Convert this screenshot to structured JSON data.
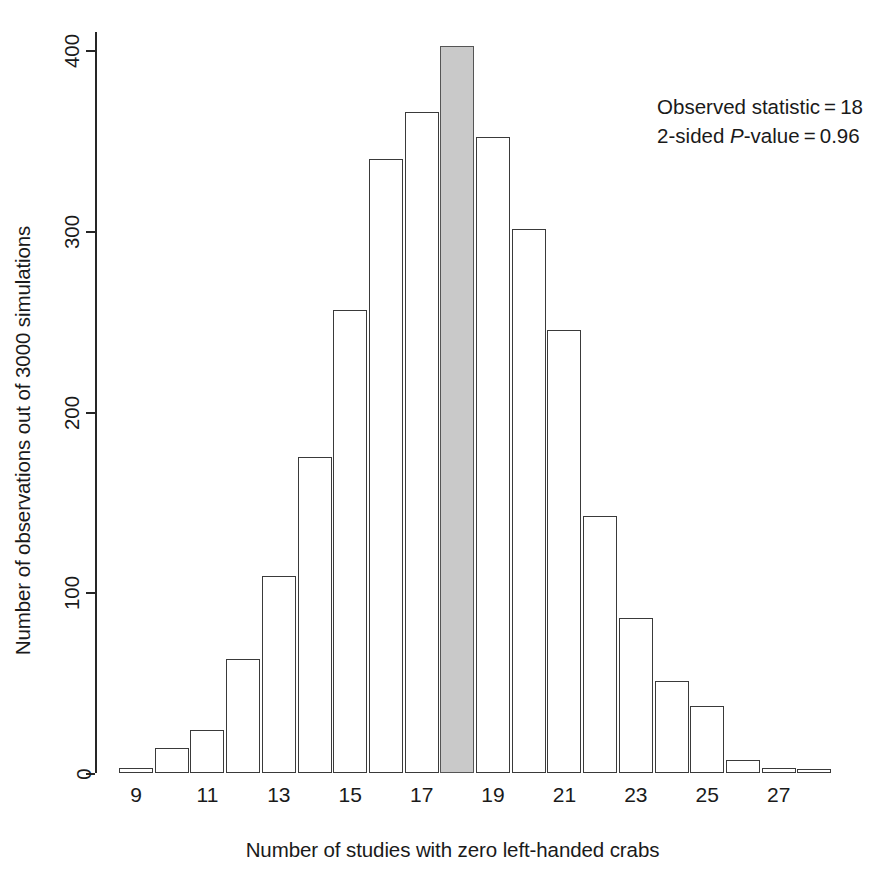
{
  "chart_data": {
    "type": "bar",
    "title": "",
    "xlabel": "Number of studies with zero left-handed crabs",
    "ylabel": "Number of observations out of 3000 simulations",
    "categories": [
      9,
      10,
      11,
      12,
      13,
      14,
      15,
      16,
      17,
      18,
      19,
      20,
      21,
      22,
      23,
      24,
      25,
      26,
      27,
      28
    ],
    "values": [
      3,
      14,
      24,
      63,
      109,
      175,
      256,
      340,
      366,
      402,
      352,
      301,
      245,
      142,
      86,
      51,
      37,
      7,
      3,
      1
    ],
    "highlight_category": 18,
    "highlight_color": "#c9c9c9",
    "bar_edge_color": "#3a3a3a",
    "bar_fill_color": "#ffffff",
    "ylim": [
      0,
      410
    ],
    "ytick_values": [
      0,
      100,
      200,
      300,
      400
    ],
    "ytick_labels": [
      "0",
      "100",
      "200",
      "300",
      "400"
    ],
    "xtick_values": [
      9,
      11,
      13,
      15,
      17,
      19,
      21,
      23,
      25,
      27
    ],
    "xtick_labels": [
      "9",
      "11",
      "13",
      "15",
      "17",
      "19",
      "21",
      "23",
      "25",
      "27"
    ],
    "grid": false,
    "legend": false,
    "annotations": [
      "Observed statistic = 18",
      "2-sided P-value = 0.96"
    ]
  },
  "annotation": {
    "line1_prefix": "Observed statistic = 18",
    "line2_prefix": "2-sided ",
    "line2_italic": "P",
    "line2_suffix": "-value = 0.96"
  }
}
